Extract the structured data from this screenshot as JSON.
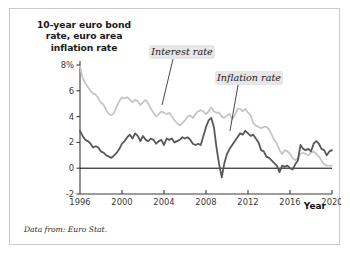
{
  "figure": {
    "title": "10-year euro bond rate, euro area inflation rate",
    "title_lines": [
      "10-year euro bond",
      "rate, euro area",
      "inflation rate"
    ],
    "source_note": "Data from: Euro Stat.",
    "xaxis_title": "Year",
    "callouts": [
      {
        "label": "Interest rate"
      },
      {
        "label": "Inflation rate"
      }
    ],
    "colors": {
      "interest_rate": "#c6c6c6",
      "inflation_rate": "#585858",
      "axis": "#3a3a3a",
      "zero_line": "#000000",
      "callout_background": "#e6e6e6",
      "card_border": "#c9c9c9"
    }
  },
  "chart_data": {
    "type": "line",
    "title": "10-year euro bond rate, euro area inflation rate",
    "xlabel": "Year",
    "ylabel": "",
    "xlim": [
      1996,
      2020
    ],
    "ylim": [
      -2,
      8
    ],
    "ytick_labels": [
      "8%",
      "6",
      "4",
      "2",
      "0",
      "-2"
    ],
    "ytick_values": [
      8,
      6,
      4,
      2,
      0,
      -2
    ],
    "xtick_labels": [
      "1996",
      "2000",
      "2004",
      "2008",
      "2012",
      "2016",
      "2020"
    ],
    "xtick_values": [
      1996,
      2000,
      2004,
      2008,
      2012,
      2016,
      2020
    ],
    "grid": false,
    "legend": "inline annotations",
    "annotations": [
      "Interest rate",
      "Inflation rate"
    ],
    "series": [
      {
        "name": "Interest rate",
        "color": "#c6c6c6",
        "x": [
          1996.0,
          1996.25,
          1996.5,
          1996.75,
          1997.0,
          1997.25,
          1997.5,
          1997.75,
          1998.0,
          1998.25,
          1998.5,
          1998.75,
          1999.0,
          1999.25,
          1999.5,
          1999.75,
          2000.0,
          2000.25,
          2000.5,
          2000.75,
          2001.0,
          2001.25,
          2001.5,
          2001.75,
          2002.0,
          2002.25,
          2002.5,
          2002.75,
          2003.0,
          2003.25,
          2003.5,
          2003.75,
          2004.0,
          2004.25,
          2004.5,
          2004.75,
          2005.0,
          2005.25,
          2005.5,
          2005.75,
          2006.0,
          2006.25,
          2006.5,
          2006.75,
          2007.0,
          2007.25,
          2007.5,
          2007.75,
          2008.0,
          2008.25,
          2008.5,
          2008.75,
          2009.0,
          2009.25,
          2009.5,
          2009.75,
          2010.0,
          2010.25,
          2010.5,
          2010.75,
          2011.0,
          2011.25,
          2011.5,
          2011.75,
          2012.0,
          2012.25,
          2012.5,
          2012.75,
          2013.0,
          2013.25,
          2013.5,
          2013.75,
          2014.0,
          2014.25,
          2014.5,
          2014.75,
          2015.0,
          2015.25,
          2015.5,
          2015.75,
          2016.0,
          2016.25,
          2016.5,
          2016.75,
          2017.0,
          2017.25,
          2017.5,
          2017.75,
          2018.0,
          2018.25,
          2018.5,
          2018.75,
          2019.0,
          2019.25,
          2019.5,
          2019.75,
          2020.0
        ],
        "y": [
          7.9,
          7.0,
          6.6,
          6.3,
          6.0,
          5.8,
          5.7,
          5.4,
          5.1,
          4.9,
          4.5,
          4.2,
          4.1,
          4.3,
          4.8,
          5.2,
          5.5,
          5.4,
          5.5,
          5.3,
          5.1,
          5.3,
          5.2,
          4.9,
          5.1,
          5.3,
          5.0,
          4.6,
          4.3,
          4.0,
          4.2,
          4.4,
          4.3,
          4.2,
          4.3,
          4.0,
          3.7,
          3.5,
          3.3,
          3.5,
          3.7,
          4.0,
          4.1,
          3.9,
          4.2,
          4.4,
          4.5,
          4.4,
          4.2,
          4.4,
          4.7,
          4.4,
          4.3,
          4.3,
          4.0,
          3.9,
          4.1,
          4.2,
          3.8,
          4.1,
          4.6,
          4.6,
          4.4,
          4.6,
          4.3,
          4.1,
          3.5,
          3.3,
          3.2,
          3.1,
          3.2,
          3.2,
          3.0,
          2.6,
          2.2,
          1.9,
          1.4,
          1.1,
          1.4,
          1.3,
          1.1,
          0.8,
          0.6,
          0.8,
          1.1,
          1.2,
          1.1,
          1.0,
          1.2,
          1.3,
          1.1,
          0.9,
          0.6,
          0.3,
          0.2,
          0.2,
          0.2
        ]
      },
      {
        "name": "Inflation rate",
        "color": "#585858",
        "x": [
          1996.0,
          1996.25,
          1996.5,
          1996.75,
          1997.0,
          1997.25,
          1997.5,
          1997.75,
          1998.0,
          1998.25,
          1998.5,
          1998.75,
          1999.0,
          1999.25,
          1999.5,
          1999.75,
          2000.0,
          2000.25,
          2000.5,
          2000.75,
          2001.0,
          2001.25,
          2001.5,
          2001.75,
          2002.0,
          2002.25,
          2002.5,
          2002.75,
          2003.0,
          2003.25,
          2003.5,
          2003.75,
          2004.0,
          2004.25,
          2004.5,
          2004.75,
          2005.0,
          2005.25,
          2005.5,
          2005.75,
          2006.0,
          2006.25,
          2006.5,
          2006.75,
          2007.0,
          2007.25,
          2007.5,
          2007.75,
          2008.0,
          2008.25,
          2008.5,
          2008.75,
          2009.0,
          2009.25,
          2009.5,
          2009.75,
          2010.0,
          2010.25,
          2010.5,
          2010.75,
          2011.0,
          2011.25,
          2011.5,
          2011.75,
          2012.0,
          2012.25,
          2012.5,
          2012.75,
          2013.0,
          2013.25,
          2013.5,
          2013.75,
          2014.0,
          2014.25,
          2014.5,
          2014.75,
          2015.0,
          2015.25,
          2015.5,
          2015.75,
          2016.0,
          2016.25,
          2016.5,
          2016.75,
          2017.0,
          2017.25,
          2017.5,
          2017.75,
          2018.0,
          2018.25,
          2018.5,
          2018.75,
          2019.0,
          2019.25,
          2019.5,
          2019.75,
          2020.0
        ],
        "y": [
          2.9,
          2.5,
          2.2,
          2.1,
          1.9,
          1.6,
          1.7,
          1.6,
          1.3,
          1.2,
          1.0,
          0.9,
          0.8,
          1.0,
          1.2,
          1.5,
          1.9,
          2.1,
          2.4,
          2.6,
          2.3,
          2.7,
          2.5,
          2.1,
          2.5,
          2.2,
          2.1,
          2.3,
          2.2,
          1.9,
          2.1,
          2.2,
          1.8,
          2.3,
          2.2,
          2.3,
          2.0,
          2.1,
          2.2,
          2.4,
          2.3,
          2.4,
          2.2,
          1.9,
          1.8,
          1.9,
          1.8,
          2.5,
          3.2,
          3.7,
          3.9,
          3.2,
          1.6,
          0.3,
          -0.7,
          0.4,
          1.1,
          1.5,
          1.8,
          2.1,
          2.4,
          2.7,
          2.6,
          2.9,
          2.7,
          2.5,
          2.6,
          2.3,
          2.0,
          1.4,
          1.3,
          0.9,
          0.8,
          0.6,
          0.4,
          0.2,
          -0.3,
          0.2,
          0.1,
          0.2,
          0.0,
          -0.1,
          0.3,
          0.6,
          1.8,
          1.5,
          1.4,
          1.5,
          1.3,
          1.9,
          2.1,
          1.9,
          1.5,
          1.4,
          1.0,
          1.3,
          1.4
        ]
      }
    ]
  }
}
